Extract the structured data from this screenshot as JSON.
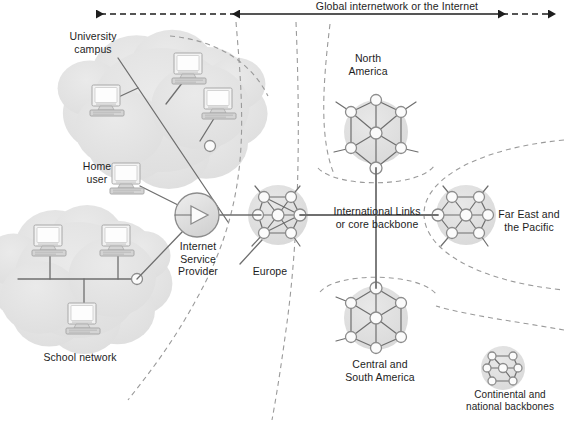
{
  "diagram": {
    "title_arrow": {
      "label": "Global internetwork or the Internet",
      "solid_arrow_x1": 240,
      "solid_arrow_x2": 498,
      "dashed_left_x": 88,
      "dashed_right_x": 556,
      "y": 14
    },
    "colors": {
      "cloud_fill": "#e3e3e3",
      "cluster_fill": "#e0e0e0",
      "node_fill": "#fbfbfb",
      "node_stroke": "#8c8c8c",
      "link": "#6f6f6f",
      "dashed": "#9a9a9a",
      "text": "#1d1d1d",
      "computer_light": "#f2f2f2",
      "computer_mid": "#d4d4d4",
      "computer_dark": "#a8a8a8",
      "arrow": "#1d1d1d"
    },
    "labels": [
      {
        "name": "university-campus-label",
        "text": "University\ncampus",
        "x": 53,
        "y": 30,
        "w": 80
      },
      {
        "name": "home-user-label",
        "text": "Home\nuser",
        "x": 72,
        "y": 160,
        "w": 50
      },
      {
        "name": "school-network-label",
        "text": "School network",
        "x": 25,
        "y": 351,
        "w": 110
      },
      {
        "name": "isp-label",
        "text": "Internet\nService\nProvider",
        "x": 163,
        "y": 240,
        "w": 70
      },
      {
        "name": "europe-label",
        "text": "Europe",
        "x": 242,
        "y": 265,
        "w": 56
      },
      {
        "name": "north-america-label",
        "text": "North\nAmerica",
        "x": 336,
        "y": 52,
        "w": 64
      },
      {
        "name": "international-links-label",
        "text": "International Links\nor core backbone",
        "x": 325,
        "y": 205,
        "w": 104
      },
      {
        "name": "far-east-label",
        "text": "Far East and\nthe Pacific",
        "x": 493,
        "y": 208,
        "w": 72
      },
      {
        "name": "central-south-america-label",
        "text": "Central and\nSouth America",
        "x": 336,
        "y": 358,
        "w": 88
      },
      {
        "name": "continental-backbones-label",
        "text": "Continental and\nnational backbones",
        "x": 456,
        "y": 389,
        "w": 108
      }
    ],
    "clouds": [
      {
        "name": "university-campus-cloud",
        "cx": 162,
        "cy": 110,
        "rx": 85,
        "ry": 62
      },
      {
        "name": "school-network-cloud",
        "cx": 78,
        "cy": 280,
        "rx": 76,
        "ry": 58
      }
    ],
    "computers": [
      {
        "name": "computer-university-1",
        "x": 90,
        "y": 85,
        "s": 1.0
      },
      {
        "name": "computer-university-2",
        "x": 172,
        "y": 53,
        "s": 1.0
      },
      {
        "name": "computer-university-3",
        "x": 202,
        "y": 88,
        "s": 1.0
      },
      {
        "name": "computer-home-user",
        "x": 110,
        "y": 163,
        "s": 1.0
      },
      {
        "name": "computer-school-1",
        "x": 32,
        "y": 225,
        "s": 1.0
      },
      {
        "name": "computer-school-2",
        "x": 100,
        "y": 225,
        "s": 1.0
      },
      {
        "name": "computer-school-3",
        "x": 66,
        "y": 303,
        "s": 1.0
      }
    ],
    "campus_bus": {
      "x1": 118,
      "y1": 58,
      "x2": 228,
      "y2": 222
    },
    "campus_drops": [
      {
        "from": [
          112,
          100
        ],
        "to": [
          138,
          88
        ]
      },
      {
        "from": [
          186,
          78
        ],
        "to": [
          166,
          104
        ]
      },
      {
        "from": [
          218,
          112
        ],
        "to": [
          200,
          141
        ]
      }
    ],
    "campus_node": {
      "cx": 210,
      "cy": 146,
      "r": 5.5
    },
    "school_bus": {
      "x1": 18,
      "y1": 279,
      "x2": 133,
      "y2": 279
    },
    "school_drops": [
      {
        "from": [
          50,
          252
        ],
        "to": [
          50,
          279
        ]
      },
      {
        "from": [
          118,
          252
        ],
        "to": [
          118,
          279
        ]
      },
      {
        "from": [
          84,
          279
        ],
        "to": [
          84,
          305
        ]
      }
    ],
    "school_node": {
      "cx": 137,
      "cy": 279,
      "r": 5.5
    },
    "home_link": {
      "x1": 140,
      "y1": 186,
      "x2": 180,
      "y2": 206
    },
    "school_to_isp": {
      "x1": 137,
      "y1": 279,
      "x2": 183,
      "y2": 231
    },
    "isp": {
      "cx": 197,
      "cy": 215,
      "r": 22,
      "name": "isp-node"
    },
    "isp_to_europe": {
      "x1": 219,
      "y1": 215,
      "x2": 261,
      "y2": 215
    },
    "europe_leader": {
      "x1": 240,
      "y1": 264,
      "x2": 262,
      "y2": 240
    },
    "trunk_vertical": {
      "x": 376,
      "y1": 168,
      "y2": 288
    },
    "trunk_horizontal": {
      "x1": 300,
      "y1": 215,
      "x2": 438,
      "y2": 215
    },
    "clusters": [
      {
        "name": "cluster-europe",
        "cx": 278,
        "cy": 215,
        "r": 30,
        "nodes": [
          {
            "x": 258,
            "y": 215,
            "r": 5.5
          },
          {
            "x": 278,
            "y": 215,
            "r": 6
          },
          {
            "x": 300,
            "y": 215,
            "r": 6
          },
          {
            "x": 264,
            "y": 197,
            "r": 5.5
          },
          {
            "x": 291,
            "y": 197,
            "r": 5.5
          },
          {
            "x": 264,
            "y": 233,
            "r": 5.5
          },
          {
            "x": 291,
            "y": 233,
            "r": 5.5
          }
        ],
        "links": [
          [
            0,
            1
          ],
          [
            1,
            2
          ],
          [
            0,
            3
          ],
          [
            3,
            4
          ],
          [
            4,
            2
          ],
          [
            0,
            5
          ],
          [
            5,
            6
          ],
          [
            6,
            2
          ],
          [
            1,
            3
          ],
          [
            1,
            4
          ],
          [
            1,
            5
          ],
          [
            1,
            6
          ],
          [
            2,
            3
          ],
          [
            2,
            5
          ]
        ],
        "stubs": [
          {
            "from": 3,
            "to": [
              255,
              186
            ]
          },
          {
            "from": 4,
            "to": [
              300,
              186
            ]
          },
          {
            "from": 5,
            "to": [
              252,
              246
            ]
          },
          {
            "from": 6,
            "to": [
              300,
              246
            ]
          }
        ]
      },
      {
        "name": "cluster-north-america",
        "cx": 376,
        "cy": 132,
        "r": 32,
        "nodes": [
          {
            "x": 376,
            "y": 168,
            "r": 6
          },
          {
            "x": 376,
            "y": 133,
            "r": 6
          },
          {
            "x": 376,
            "y": 100,
            "r": 5.5
          },
          {
            "x": 351,
            "y": 112,
            "r": 5.5
          },
          {
            "x": 401,
            "y": 112,
            "r": 5.5
          },
          {
            "x": 351,
            "y": 148,
            "r": 5.5
          },
          {
            "x": 401,
            "y": 148,
            "r": 5.5
          }
        ],
        "links": [
          [
            0,
            1
          ],
          [
            1,
            2
          ],
          [
            1,
            3
          ],
          [
            1,
            4
          ],
          [
            1,
            5
          ],
          [
            1,
            6
          ],
          [
            3,
            2
          ],
          [
            4,
            2
          ],
          [
            3,
            5
          ],
          [
            4,
            6
          ],
          [
            0,
            5
          ],
          [
            0,
            6
          ]
        ],
        "stubs": [
          {
            "from": 3,
            "to": [
              336,
              102
            ]
          },
          {
            "from": 4,
            "to": [
              416,
              102
            ]
          },
          {
            "from": 5,
            "to": [
              334,
              152
            ]
          },
          {
            "from": 6,
            "to": [
              418,
              152
            ]
          }
        ]
      },
      {
        "name": "cluster-far-east",
        "cx": 466,
        "cy": 215,
        "r": 30,
        "nodes": [
          {
            "x": 438,
            "y": 215,
            "r": 6
          },
          {
            "x": 466,
            "y": 215,
            "r": 6
          },
          {
            "x": 488,
            "y": 215,
            "r": 5.5
          },
          {
            "x": 452,
            "y": 197,
            "r": 5.5
          },
          {
            "x": 479,
            "y": 197,
            "r": 5.5
          },
          {
            "x": 452,
            "y": 233,
            "r": 5.5
          },
          {
            "x": 479,
            "y": 233,
            "r": 5.5
          }
        ],
        "links": [
          [
            0,
            1
          ],
          [
            1,
            2
          ],
          [
            0,
            3
          ],
          [
            3,
            4
          ],
          [
            4,
            2
          ],
          [
            0,
            5
          ],
          [
            5,
            6
          ],
          [
            6,
            2
          ],
          [
            1,
            3
          ],
          [
            1,
            4
          ],
          [
            1,
            5
          ],
          [
            1,
            6
          ]
        ],
        "stubs": [
          {
            "from": 3,
            "to": [
              443,
              186
            ]
          },
          {
            "from": 4,
            "to": [
              488,
              186
            ]
          },
          {
            "from": 5,
            "to": [
              441,
              246
            ]
          },
          {
            "from": 6,
            "to": [
              488,
              246
            ]
          }
        ]
      },
      {
        "name": "cluster-central-south-america",
        "cx": 376,
        "cy": 318,
        "r": 32,
        "nodes": [
          {
            "x": 376,
            "y": 288,
            "r": 6
          },
          {
            "x": 376,
            "y": 318,
            "r": 6
          },
          {
            "x": 376,
            "y": 348,
            "r": 5.5
          },
          {
            "x": 351,
            "y": 303,
            "r": 5.5
          },
          {
            "x": 401,
            "y": 303,
            "r": 5.5
          },
          {
            "x": 351,
            "y": 337,
            "r": 5.5
          },
          {
            "x": 401,
            "y": 337,
            "r": 5.5
          }
        ],
        "links": [
          [
            0,
            1
          ],
          [
            1,
            2
          ],
          [
            0,
            3
          ],
          [
            0,
            4
          ],
          [
            1,
            3
          ],
          [
            1,
            4
          ],
          [
            1,
            5
          ],
          [
            1,
            6
          ],
          [
            3,
            5
          ],
          [
            4,
            6
          ],
          [
            2,
            5
          ],
          [
            2,
            6
          ]
        ],
        "stubs": [
          {
            "from": 3,
            "to": [
              336,
              297
            ]
          },
          {
            "from": 5,
            "to": [
              336,
              341
            ]
          }
        ]
      },
      {
        "name": "cluster-continental-backbones",
        "cx": 503,
        "cy": 368,
        "r": 22,
        "nodes": [
          {
            "x": 487,
            "y": 368,
            "r": 4
          },
          {
            "x": 503,
            "y": 368,
            "r": 4.5
          },
          {
            "x": 518,
            "y": 368,
            "r": 4
          },
          {
            "x": 492,
            "y": 356,
            "r": 4
          },
          {
            "x": 513,
            "y": 356,
            "r": 4
          },
          {
            "x": 492,
            "y": 381,
            "r": 4
          },
          {
            "x": 513,
            "y": 381,
            "r": 4
          }
        ],
        "links": [
          [
            0,
            1
          ],
          [
            1,
            2
          ],
          [
            0,
            3
          ],
          [
            3,
            4
          ],
          [
            4,
            2
          ],
          [
            0,
            5
          ],
          [
            5,
            6
          ],
          [
            6,
            2
          ],
          [
            1,
            3
          ],
          [
            1,
            6
          ]
        ],
        "stubs": []
      }
    ],
    "dashed_curves": [
      {
        "name": "dashed-divider-upper-left",
        "d": "M 236 22 C 244 120, 252 200, 196 300 C 172 344, 150 372, 128 400"
      },
      {
        "name": "dashed-divider-upper-mid",
        "d": "M 296 22 C 300 120, 300 230, 286 330 C 280 374, 276 398, 272 420"
      },
      {
        "name": "dashed-divider-campus-top",
        "d": "M 170 36 C 214 40, 250 60, 268 96"
      },
      {
        "name": "dashed-divider-na-left",
        "d": "M 330 24 C 322 90, 320 140, 334 174"
      },
      {
        "name": "dashed-arc-na",
        "d": "M 318 168 C 336 188, 418 188, 434 166"
      },
      {
        "name": "dashed-arc-far-east-top",
        "d": "M 564 140 C 480 148, 424 178, 424 214"
      },
      {
        "name": "dashed-arc-far-east-bottom",
        "d": "M 424 214 C 424 252, 482 282, 564 290"
      },
      {
        "name": "dashed-arc-csa",
        "d": "M 320 292 C 336 272, 418 272, 436 294"
      },
      {
        "name": "dashed-divider-lower-right",
        "d": "M 564 330 C 520 322, 470 316, 436 306"
      }
    ]
  }
}
